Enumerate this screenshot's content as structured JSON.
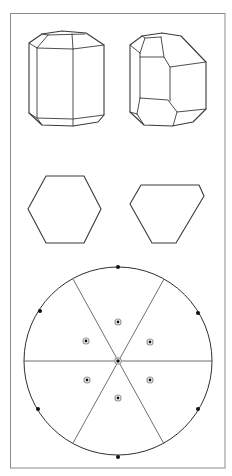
{
  "figure": {
    "panels": [
      {
        "id": "crystal-1",
        "label": "",
        "kind": "hexagonal prism with basal and pyramid faces"
      },
      {
        "id": "crystal-2",
        "label": "",
        "kind": "distorted hexagonal prism with pyramid faces"
      },
      {
        "id": "section-1",
        "label": "",
        "kind": "regular hexagon cross-section"
      },
      {
        "id": "section-2",
        "label": "",
        "kind": "irregular hexagon cross-section"
      },
      {
        "id": "stereogram",
        "label": "",
        "kind": "stereographic projection, 6-fold symmetry"
      }
    ],
    "stereogram": {
      "zone_lines_count": 3,
      "primitive_poles": 6,
      "upper_poles": 6,
      "center_pole": 1
    },
    "colors": {
      "line": "#3a3a3a",
      "frame": "#8a8a8a",
      "pole": "#111111",
      "pole_ring": "#9a9a9a"
    }
  }
}
